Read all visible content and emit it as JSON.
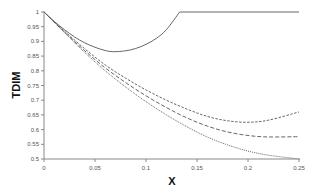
{
  "chart_data": {
    "type": "line",
    "title": "",
    "xlabel": "X",
    "ylabel": "TDIM",
    "xlim": [
      0,
      0.25
    ],
    "ylim": [
      0.5,
      1.0
    ],
    "grid": false,
    "legend": null,
    "x_ticks": [
      "0",
      "0.05",
      "0.1",
      "0.15",
      "0.2",
      "0.25"
    ],
    "y_ticks": [
      "0.5",
      "0.55",
      "0.6",
      "0.65",
      "0.7",
      "0.75",
      "0.8",
      "0.85",
      "0.9",
      "0.95",
      "1"
    ],
    "series": [
      {
        "name": "solid",
        "style": "solid",
        "x": [
          0,
          0.01,
          0.02,
          0.03,
          0.04,
          0.05,
          0.06,
          0.068,
          0.08,
          0.09,
          0.1,
          0.11,
          0.12,
          0.133,
          0.15,
          0.2,
          0.25
        ],
        "values": [
          1.0,
          0.968,
          0.94,
          0.915,
          0.895,
          0.88,
          0.869,
          0.865,
          0.868,
          0.876,
          0.89,
          0.91,
          0.94,
          1.0,
          1.0,
          1.0,
          1.0
        ]
      },
      {
        "name": "short-dash",
        "style": "short-dash",
        "x": [
          0,
          0.02,
          0.04,
          0.06,
          0.08,
          0.1,
          0.12,
          0.14,
          0.16,
          0.18,
          0.2,
          0.22,
          0.25
        ],
        "values": [
          1.0,
          0.935,
          0.875,
          0.82,
          0.775,
          0.735,
          0.7,
          0.67,
          0.645,
          0.63,
          0.625,
          0.632,
          0.66
        ]
      },
      {
        "name": "long-dash",
        "style": "long-dash",
        "x": [
          0,
          0.02,
          0.04,
          0.06,
          0.08,
          0.1,
          0.12,
          0.14,
          0.16,
          0.18,
          0.2,
          0.22,
          0.25
        ],
        "values": [
          1.0,
          0.932,
          0.868,
          0.81,
          0.76,
          0.715,
          0.675,
          0.64,
          0.612,
          0.592,
          0.58,
          0.575,
          0.576
        ]
      },
      {
        "name": "dotted",
        "style": "dotted",
        "x": [
          0,
          0.02,
          0.04,
          0.06,
          0.08,
          0.1,
          0.12,
          0.14,
          0.16,
          0.18,
          0.2,
          0.22,
          0.25
        ],
        "values": [
          1.0,
          0.93,
          0.862,
          0.8,
          0.745,
          0.695,
          0.65,
          0.61,
          0.575,
          0.548,
          0.527,
          0.513,
          0.5
        ]
      }
    ]
  },
  "colors": {
    "axis": "#888888",
    "line": "#555555",
    "label": "#555555",
    "title": "#111111"
  }
}
